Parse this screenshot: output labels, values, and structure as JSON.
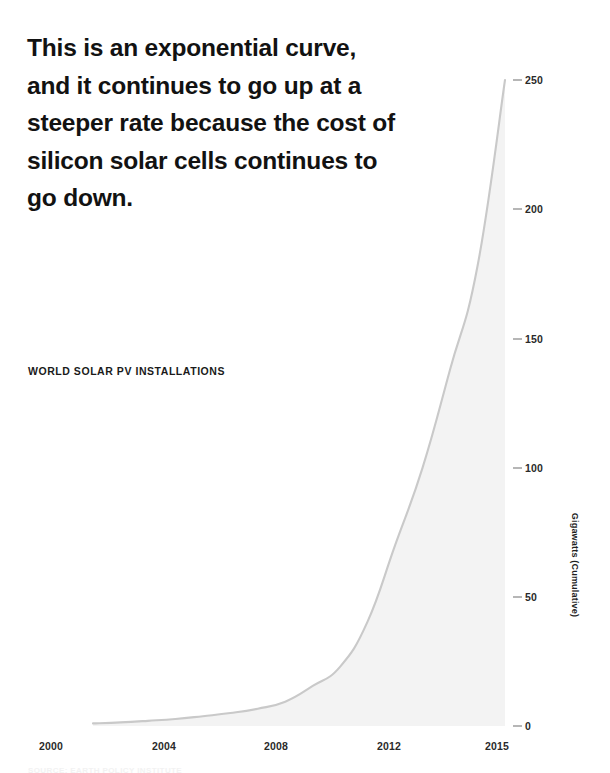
{
  "headline": {
    "text": "This is an exponential curve,\nand it continues to go up at a\nsteeper rate because the cost of\nsilicon solar cells continues to\ngo down."
  },
  "colors": {
    "text": "#121212",
    "axis_text": "#2a2a2a",
    "tick_mark": "#6f6f6f",
    "line": "#c9c9c9",
    "area_fill": "#f3f3f3",
    "background": "#ffffff"
  },
  "chart_data": {
    "type": "area",
    "title": "WORLD SOLAR PV INSTALLATIONS",
    "xlabel": "",
    "ylabel": "Gigawatts (Cumulative)",
    "xlim": [
      2000,
      2015
    ],
    "ylim": [
      0,
      250
    ],
    "grid": false,
    "legend": false,
    "legend_position": "none",
    "x_ticks": [
      "2000",
      "2004",
      "2008",
      "2012",
      "2015"
    ],
    "y_ticks": [
      "0",
      "50",
      "100",
      "150",
      "200",
      "250"
    ],
    "x": [
      2000,
      2001,
      2002,
      2003,
      2004,
      2005,
      2006,
      2007,
      2008,
      2009,
      2010,
      2011,
      2012,
      2013,
      2014,
      2015
    ],
    "values": [
      1.0,
      1.4,
      2.0,
      2.7,
      3.8,
      5.0,
      6.7,
      9.4,
      15.5,
      23.0,
      40.5,
      70.0,
      100.0,
      138.0,
      178.0,
      250.0
    ],
    "series_name": "World solar PV installations (cumulative)",
    "units": "Gigawatts"
  },
  "axis": {
    "y_label_text": "Gigawatts (Cumulative)"
  },
  "footer": {
    "source": "SOURCE: EARTH POLICY INSTITUTE"
  }
}
